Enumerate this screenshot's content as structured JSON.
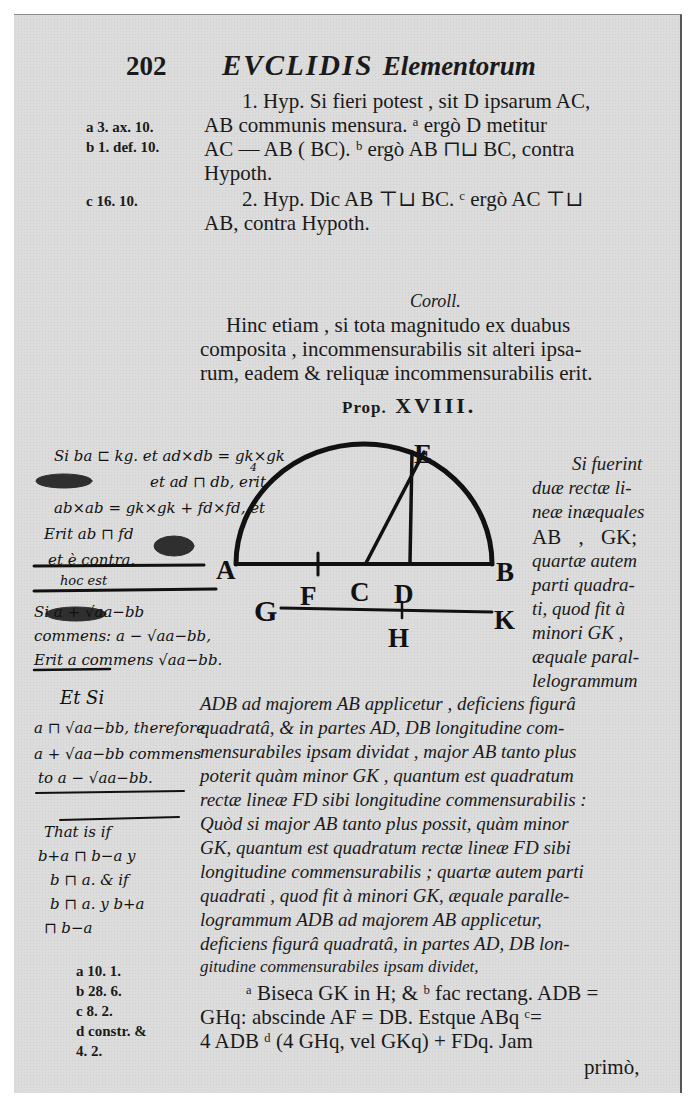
{
  "header": {
    "page_number": "202",
    "running_title": "EVCLIDIS",
    "running_title_sub": "Elementorum"
  },
  "proof_part1": {
    "lines": [
      "1. Hyp. Si fieri potest , sit D ipsarum AC,",
      "AB communis mensura. ᵃ ergò D metitur",
      "AC — AB ( BC). ᵇ ergò AB ⊓⊔ BC, contra",
      "Hypoth.",
      "2. Hyp. Dic AB ⊤⊔ BC. ᶜ ergò AC ⊤⊔",
      "AB, contra Hypoth."
    ],
    "margin_refs": [
      "a 3. ax. 10.",
      "b 1. def. 10.",
      "c 16. 10."
    ]
  },
  "corollary": {
    "heading": "Coroll.",
    "lines": [
      "Hinc etiam , si tota magnitudo ex duabus",
      "composita , incommensurabilis sit alteri ipsa-",
      "rum, eadem & reliquæ incommensurabilis erit."
    ]
  },
  "proposition": {
    "heading_prefix": "Prop.",
    "heading_number": "XVIII.",
    "side_text": [
      "Si fuerint",
      "duæ rectæ li-",
      "neæ inæquales",
      "AB , GK;",
      "quartæ autem",
      "parti quadra-",
      "ti, quod fit à",
      "minori GK ,",
      "æquale paral-",
      "lelogrammum"
    ],
    "body_lines": [
      "ADB ad majorem AB applicetur , deficiens figurâ",
      "quadratâ, & in partes AD, DB longitudine com-",
      "mensurabiles ipsam dividat , major AB tanto plus",
      "poterit quàm minor GK , quantum est quadratum",
      "rectæ lineæ FD sibi longitudine commensurabilis :",
      "Quòd si major AB tanto plus possit, quàm minor",
      "GK, quantum est quadratum rectæ lineæ FD sibi",
      "longitudine commensurabilis ; quartæ autem parti",
      "quadrati , quod fit à minori GK, æquale paralle-",
      "logrammum ADB ad majorem AB applicetur,",
      "deficiens figurâ quadratâ, in partes AD, DB lon-",
      "gitudine commensurabiles ipsam dividet,"
    ]
  },
  "diagram": {
    "labels": {
      "A": "A",
      "B": "B",
      "C": "C",
      "D": "D",
      "E": "E",
      "F": "F",
      "G": "G",
      "H": "H",
      "K": "K"
    }
  },
  "handwritten_notes": {
    "lines": [
      "Si ba ⊏ kg. et ad×db = gk×gk",
      "et ad ⊓ db, erit",
      "ab×ab = gk×gk + fd×fd, et",
      "Erit ab ⊓ fd",
      "et è contra.",
      "hoc est",
      "Si a + √aa−bb",
      "commens: a − √aa−bb,",
      "Erit a commens √aa−bb.",
      "Et Si",
      "a ⊓ √aa−bb, therefore",
      "a + √aa−bb commens",
      "to a − √aa−bb.",
      "That is if",
      "b+a ⊓ b−a  y",
      "b ⊓ a.  & if",
      "b ⊓ a.  y b+a",
      "⊓ b−a"
    ],
    "fraction_denominator": "4"
  },
  "construction": {
    "lines": [
      "ᵃ Biseca GK in H; & ᵇ fac rectang. ADB =",
      "GHq: abscinde AF = DB. Estque ABq ᶜ=",
      "4 ADB ᵈ (4 GHq, vel GKq) + FDq. Jam",
      "primò,"
    ],
    "margin_refs": [
      "a 10. 1.",
      "b 28. 6.",
      "c 8. 2.",
      "d constr. &",
      "4. 2."
    ]
  }
}
